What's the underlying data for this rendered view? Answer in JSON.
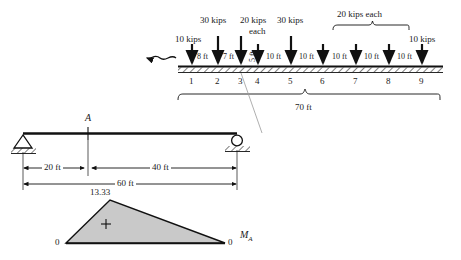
{
  "figure": {
    "title_absent": true,
    "moving_load_train": {
      "direction_icon": "wavy-left-arrow",
      "span_label": "70 ft",
      "group_brace_label": "20 kips each",
      "loads": [
        {
          "node": "1",
          "magnitude_label": "10 kips"
        },
        {
          "node": "2",
          "magnitude_label": "30 kips"
        },
        {
          "node": "3",
          "magnitude_label": "20 kips"
        },
        {
          "node": "4",
          "magnitude_label": "each"
        },
        {
          "node": "5",
          "magnitude_label": "30 kips"
        },
        {
          "node": "6",
          "magnitude_label": ""
        },
        {
          "node": "7",
          "magnitude_label": ""
        },
        {
          "node": "8",
          "magnitude_label": ""
        },
        {
          "node": "9",
          "magnitude_label": "10 kips"
        }
      ],
      "node_labels": [
        "1",
        "2",
        "3",
        "4",
        "5",
        "6",
        "7",
        "8",
        "9"
      ],
      "spacings": [
        "8 ft",
        "7 ft",
        "5 ft",
        "10 ft",
        "10 ft",
        "10 ft",
        "10 ft",
        "10 ft"
      ],
      "spacing_rotated_index": 2,
      "headers": {
        "h_10kips_left": "10 kips",
        "h_30kips_a": "30 kips",
        "h_20kips": "20 kips",
        "h_each": "each",
        "h_30kips_b": "30 kips",
        "h_20kips_each": "20 kips each",
        "h_10kips_right": "10 kips"
      }
    },
    "beam": {
      "point_label": "A",
      "left_support": "pin-support",
      "right_support": "roller-support",
      "dim_left": "20 ft",
      "dim_right": "40 ft",
      "dim_total": "60 ft"
    },
    "influence_line": {
      "peak_value": "13.33",
      "left_zero": "0",
      "right_zero": "0",
      "sign": "+",
      "quantity_label": "M",
      "quantity_sub": "A",
      "fill_color": "#c9c9c9"
    }
  }
}
